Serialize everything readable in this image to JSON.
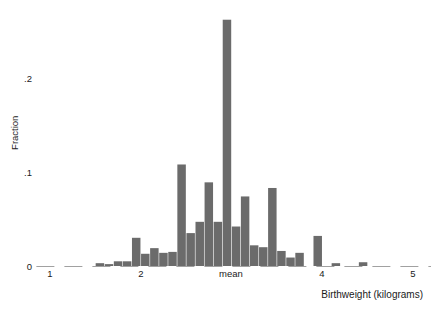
{
  "chart_data": {
    "type": "bar",
    "title": "",
    "subtitle": "",
    "xlabel": "Birthweight (kilograms)",
    "ylabel": "Fraction",
    "xlim": [
      0.85,
      5.35
    ],
    "ylim": [
      0,
      0.27
    ],
    "grid": false,
    "legend": null,
    "bar_color": "#6b6b6b",
    "axis_color": "#555555",
    "bin_width": 0.1,
    "x_ticks": [
      {
        "value": 1,
        "label": "1"
      },
      {
        "value": 2,
        "label": "2"
      },
      {
        "value": 3,
        "label": "mean"
      },
      {
        "value": 4,
        "label": "4"
      },
      {
        "value": 5,
        "label": "5"
      }
    ],
    "y_ticks": [
      {
        "value": 0,
        "label": "0"
      },
      {
        "value": 0.1,
        "label": ".1"
      },
      {
        "value": 0.2,
        "label": ".2"
      }
    ],
    "annotations": [
      {
        "text": "mean",
        "x": 3,
        "where": "x-axis-tick"
      }
    ],
    "categories": [
      1.05,
      1.15,
      1.25,
      1.35,
      1.45,
      1.55,
      1.65,
      1.75,
      1.85,
      1.95,
      2.05,
      2.15,
      2.25,
      2.35,
      2.45,
      2.55,
      2.65,
      2.75,
      2.85,
      2.95,
      3.05,
      3.15,
      3.25,
      3.35,
      3.45,
      3.55,
      3.65,
      3.75,
      3.85,
      3.95,
      4.05,
      4.15,
      4.25,
      4.35,
      4.45,
      4.55,
      4.65,
      4.75,
      4.85,
      4.95,
      5.05,
      5.15
    ],
    "values": [
      0.0,
      0.0,
      0.0,
      0.0,
      0.0,
      0.003,
      0.002,
      0.005,
      0.005,
      0.03,
      0.013,
      0.019,
      0.014,
      0.015,
      0.108,
      0.035,
      0.047,
      0.089,
      0.047,
      0.262,
      0.042,
      0.074,
      0.022,
      0.02,
      0.083,
      0.016,
      0.009,
      0.014,
      0.0,
      0.032,
      0.0,
      0.003,
      0.0,
      0.0,
      0.004,
      0.0,
      0.0,
      0.0,
      0.0,
      0.0,
      0.0,
      0.0
    ],
    "series": [
      {
        "name": "Fraction",
        "values": [
          0.0,
          0.0,
          0.0,
          0.0,
          0.0,
          0.003,
          0.002,
          0.005,
          0.005,
          0.03,
          0.013,
          0.019,
          0.014,
          0.015,
          0.108,
          0.035,
          0.047,
          0.089,
          0.047,
          0.262,
          0.042,
          0.074,
          0.022,
          0.02,
          0.083,
          0.016,
          0.009,
          0.014,
          0.0,
          0.032,
          0.0,
          0.003,
          0.0,
          0.0,
          0.004,
          0.0,
          0.0,
          0.0,
          0.0,
          0.0,
          0.0,
          0.0
        ]
      }
    ]
  }
}
